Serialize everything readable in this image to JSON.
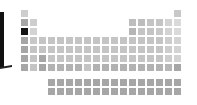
{
  "chart_data": {
    "type": "heatmap",
    "title": "",
    "layout": "periodic-table",
    "colormap": "greys",
    "origin": {
      "x": 21,
      "y": 10
    },
    "pitch": 9,
    "cells": [
      {
        "p": 1,
        "g": 1,
        "v": 0.18
      },
      {
        "p": 1,
        "g": 18,
        "v": 0.2
      },
      {
        "p": 2,
        "g": 1,
        "v": 0.35
      },
      {
        "p": 2,
        "g": 2,
        "v": 0.18
      },
      {
        "p": 2,
        "g": 13,
        "v": 0.25
      },
      {
        "p": 2,
        "g": 14,
        "v": 0.25
      },
      {
        "p": 2,
        "g": 15,
        "v": 0.22
      },
      {
        "p": 2,
        "g": 16,
        "v": 0.22
      },
      {
        "p": 2,
        "g": 17,
        "v": 0.15
      },
      {
        "p": 2,
        "g": 18,
        "v": 0.12
      },
      {
        "p": 3,
        "g": 1,
        "v": 1.0
      },
      {
        "p": 3,
        "g": 2,
        "v": 0.15
      },
      {
        "p": 3,
        "g": 13,
        "v": 0.28
      },
      {
        "p": 3,
        "g": 14,
        "v": 0.22
      },
      {
        "p": 3,
        "g": 15,
        "v": 0.22
      },
      {
        "p": 3,
        "g": 16,
        "v": 0.2
      },
      {
        "p": 3,
        "g": 17,
        "v": 0.15
      },
      {
        "p": 3,
        "g": 18,
        "v": 0.12
      },
      {
        "p": 4,
        "g": 1,
        "v": 0.35
      },
      {
        "p": 4,
        "g": 2,
        "v": 0.2
      },
      {
        "p": 4,
        "g": 3,
        "v": 0.22
      },
      {
        "p": 4,
        "g": 4,
        "v": 0.22
      },
      {
        "p": 4,
        "g": 5,
        "v": 0.22
      },
      {
        "p": 4,
        "g": 6,
        "v": 0.22
      },
      {
        "p": 4,
        "g": 7,
        "v": 0.22
      },
      {
        "p": 4,
        "g": 8,
        "v": 0.22
      },
      {
        "p": 4,
        "g": 9,
        "v": 0.22
      },
      {
        "p": 4,
        "g": 10,
        "v": 0.22
      },
      {
        "p": 4,
        "g": 11,
        "v": 0.22
      },
      {
        "p": 4,
        "g": 12,
        "v": 0.22
      },
      {
        "p": 4,
        "g": 13,
        "v": 0.22
      },
      {
        "p": 4,
        "g": 14,
        "v": 0.22
      },
      {
        "p": 4,
        "g": 15,
        "v": 0.22
      },
      {
        "p": 4,
        "g": 16,
        "v": 0.22
      },
      {
        "p": 4,
        "g": 17,
        "v": 0.18
      },
      {
        "p": 4,
        "g": 18,
        "v": 0.15
      },
      {
        "p": 5,
        "g": 1,
        "v": 0.35
      },
      {
        "p": 5,
        "g": 2,
        "v": 0.22
      },
      {
        "p": 5,
        "g": 3,
        "v": 0.22
      },
      {
        "p": 5,
        "g": 4,
        "v": 0.22
      },
      {
        "p": 5,
        "g": 5,
        "v": 0.22
      },
      {
        "p": 5,
        "g": 6,
        "v": 0.22
      },
      {
        "p": 5,
        "g": 7,
        "v": 0.22
      },
      {
        "p": 5,
        "g": 8,
        "v": 0.22
      },
      {
        "p": 5,
        "g": 9,
        "v": 0.22
      },
      {
        "p": 5,
        "g": 10,
        "v": 0.22
      },
      {
        "p": 5,
        "g": 11,
        "v": 0.22
      },
      {
        "p": 5,
        "g": 12,
        "v": 0.22
      },
      {
        "p": 5,
        "g": 13,
        "v": 0.22
      },
      {
        "p": 5,
        "g": 14,
        "v": 0.22
      },
      {
        "p": 5,
        "g": 15,
        "v": 0.22
      },
      {
        "p": 5,
        "g": 16,
        "v": 0.22
      },
      {
        "p": 5,
        "g": 17,
        "v": 0.18
      },
      {
        "p": 5,
        "g": 18,
        "v": 0.15
      },
      {
        "p": 6,
        "g": 1,
        "v": 0.35
      },
      {
        "p": 6,
        "g": 2,
        "v": 0.22
      },
      {
        "p": 6,
        "g": 3,
        "v": 0.35
      },
      {
        "p": 6,
        "g": 4,
        "v": 0.22
      },
      {
        "p": 6,
        "g": 5,
        "v": 0.22
      },
      {
        "p": 6,
        "g": 6,
        "v": 0.22
      },
      {
        "p": 6,
        "g": 7,
        "v": 0.22
      },
      {
        "p": 6,
        "g": 8,
        "v": 0.22
      },
      {
        "p": 6,
        "g": 9,
        "v": 0.22
      },
      {
        "p": 6,
        "g": 10,
        "v": 0.22
      },
      {
        "p": 6,
        "g": 11,
        "v": 0.22
      },
      {
        "p": 6,
        "g": 12,
        "v": 0.22
      },
      {
        "p": 6,
        "g": 13,
        "v": 0.22
      },
      {
        "p": 6,
        "g": 14,
        "v": 0.22
      },
      {
        "p": 6,
        "g": 15,
        "v": 0.22
      },
      {
        "p": 6,
        "g": 16,
        "v": 0.22
      },
      {
        "p": 6,
        "g": 17,
        "v": 0.18
      },
      {
        "p": 6,
        "g": 18,
        "v": 0.15
      },
      {
        "p": 7,
        "g": 1,
        "v": 0.35
      },
      {
        "p": 7,
        "g": 2,
        "v": 0.22
      },
      {
        "p": 7,
        "g": 3,
        "v": 0.35
      },
      {
        "p": 7,
        "g": 4,
        "v": 0.3
      },
      {
        "p": 7,
        "g": 5,
        "v": 0.3
      },
      {
        "p": 7,
        "g": 6,
        "v": 0.3
      },
      {
        "p": 7,
        "g": 7,
        "v": 0.3
      },
      {
        "p": 7,
        "g": 8,
        "v": 0.22
      },
      {
        "p": 7,
        "g": 9,
        "v": 0.3
      },
      {
        "p": 7,
        "g": 10,
        "v": 0.3
      },
      {
        "p": 7,
        "g": 11,
        "v": 0.3
      },
      {
        "p": 7,
        "g": 12,
        "v": 0.3
      },
      {
        "p": 7,
        "g": 13,
        "v": 0.3
      },
      {
        "p": 7,
        "g": 14,
        "v": 0.3
      },
      {
        "p": 7,
        "g": 15,
        "v": 0.3
      },
      {
        "p": 7,
        "g": 16,
        "v": 0.3
      },
      {
        "p": 7,
        "g": 17,
        "v": 0.28
      },
      {
        "p": 7,
        "g": 18,
        "v": 0.35
      }
    ],
    "f_block": {
      "lanthanides": {
        "y": 79,
        "x_start": 48,
        "count": 15,
        "v": 0.35
      },
      "actinides": {
        "y": 88,
        "x_start": 48,
        "count": 15,
        "v": 0.35
      }
    },
    "colorbar": {
      "position": "left",
      "visible": "partial"
    }
  }
}
